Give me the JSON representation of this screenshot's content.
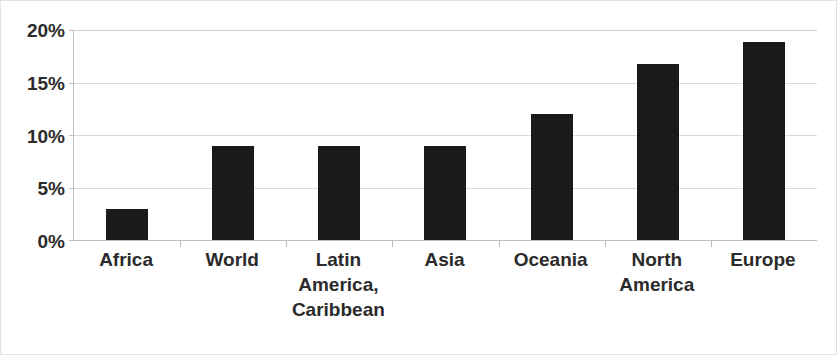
{
  "chart_data": {
    "type": "bar",
    "title": "",
    "subtitle": "",
    "xlabel": "",
    "ylabel": "",
    "categories": [
      "Africa",
      "Latin America, Caribbean",
      "World",
      "Asia",
      "Oceania",
      "North America",
      "Europe"
    ],
    "category_lines": [
      [
        "Africa"
      ],
      [
        "World"
      ],
      [
        "Latin",
        "America,",
        "Caribbean"
      ],
      [
        "Asia"
      ],
      [
        "Oceania"
      ],
      [
        "North",
        "America"
      ],
      [
        "Europe"
      ]
    ],
    "category_order": [
      "Africa",
      "World",
      "Latin America, Caribbean",
      "Asia",
      "Oceania",
      "North America",
      "Europe"
    ],
    "values": [
      3,
      9,
      9,
      9,
      12,
      16.8,
      18.9
    ],
    "value_format": "percent",
    "ylim": [
      0,
      20
    ],
    "yticks": [
      0,
      5,
      10,
      15,
      20
    ],
    "ytick_labels": [
      "0%",
      "5%",
      "10%",
      "15%",
      "20%"
    ],
    "grid": true,
    "legend": false,
    "legend_position": "none",
    "bar_color": "#1a1a1a",
    "gridline_color": "#d9d9d9",
    "axis_color": "#bfbfbf",
    "background_color": "#ffffff",
    "text_color": "#2b2b2b"
  }
}
